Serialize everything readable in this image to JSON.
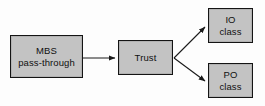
{
  "diagram": {
    "type": "flow-diagram",
    "background_color": "#fdfdfd",
    "node_fill_color": "#c3c3c3",
    "node_border_color": "#141414",
    "edge_color": "#1a1a1a",
    "nodes": [
      {
        "id": "mbs",
        "lines": [
          "MBS",
          "pass-through"
        ],
        "line1": "MBS",
        "line2": "pass-through",
        "x": 10,
        "y": 35,
        "w": 73,
        "h": 43
      },
      {
        "id": "trust",
        "lines": [
          "Trust"
        ],
        "line1": "Trust",
        "line2": "",
        "x": 118,
        "y": 40,
        "w": 55,
        "h": 35
      },
      {
        "id": "io",
        "lines": [
          "IO",
          "class"
        ],
        "line1": "IO",
        "line2": "class",
        "x": 208,
        "y": 8,
        "w": 45,
        "h": 35
      },
      {
        "id": "po",
        "lines": [
          "PO",
          "class"
        ],
        "line1": "PO",
        "line2": "class",
        "x": 208,
        "y": 63,
        "w": 45,
        "h": 35
      }
    ],
    "edges": [
      {
        "id": "mbs-to-trust",
        "from": "mbs",
        "to": "trust",
        "label": "",
        "style": "solid-arrow"
      },
      {
        "id": "trust-to-io",
        "from": "trust",
        "to": "io",
        "label": "",
        "style": "solid-arrow"
      },
      {
        "id": "trust-to-po",
        "from": "trust",
        "to": "po",
        "label": "",
        "style": "solid-arrow"
      }
    ]
  }
}
